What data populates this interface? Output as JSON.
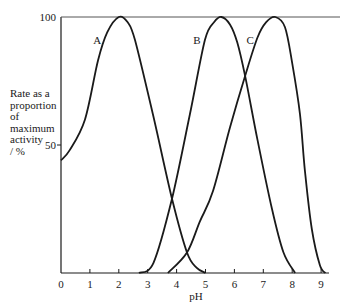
{
  "chart_data": {
    "type": "line",
    "title": "",
    "xlabel": "pH",
    "ylabel_lines": [
      "Rate as a",
      "proportion",
      "of",
      "maximum",
      "activity",
      "/ %"
    ],
    "ylabel": "Rate as a proportion of maximum activity / %",
    "xlim": [
      0,
      9.3
    ],
    "ylim": [
      0,
      100
    ],
    "x_ticks": [
      "0",
      "1",
      "2",
      "3",
      "4",
      "5",
      "6",
      "7",
      "8",
      "9"
    ],
    "y_ticks": [
      "50",
      "100"
    ],
    "grid": false,
    "legend": "inline curve labels",
    "series": [
      {
        "name": "A",
        "label_pos": [
          1.25,
          91
        ],
        "peak": [
          2.0,
          100
        ],
        "points": [
          [
            0,
            44
          ],
          [
            0.3,
            48
          ],
          [
            0.83,
            60
          ],
          [
            1.28,
            83
          ],
          [
            1.6,
            94
          ],
          [
            2.0,
            100
          ],
          [
            2.3,
            98
          ],
          [
            2.56,
            91
          ],
          [
            3.18,
            62
          ],
          [
            3.84,
            29
          ],
          [
            4.36,
            8
          ],
          [
            4.7,
            2
          ],
          [
            5.0,
            0
          ]
        ]
      },
      {
        "name": "B",
        "label_pos": [
          4.7,
          91
        ],
        "peak": [
          5.55,
          100
        ],
        "points": [
          [
            2.7,
            0
          ],
          [
            3.2,
            4
          ],
          [
            3.84,
            29
          ],
          [
            4.46,
            62
          ],
          [
            4.98,
            91
          ],
          [
            5.3,
            98
          ],
          [
            5.55,
            100
          ],
          [
            5.85,
            97
          ],
          [
            6.1,
            90
          ],
          [
            6.37,
            77
          ],
          [
            6.8,
            52
          ],
          [
            7.3,
            25
          ],
          [
            7.7,
            8
          ],
          [
            8.1,
            0
          ]
        ]
      },
      {
        "name": "C",
        "label_pos": [
          6.55,
          91
        ],
        "peak": [
          7.42,
          100
        ],
        "points": [
          [
            3.7,
            0
          ],
          [
            4.36,
            8
          ],
          [
            4.8,
            20
          ],
          [
            5.26,
            32
          ],
          [
            5.85,
            57
          ],
          [
            6.37,
            77
          ],
          [
            6.8,
            92
          ],
          [
            7.1,
            98
          ],
          [
            7.42,
            100
          ],
          [
            7.75,
            96
          ],
          [
            8.0,
            82
          ],
          [
            8.27,
            62
          ],
          [
            8.44,
            40
          ],
          [
            8.68,
            17
          ],
          [
            8.96,
            3
          ],
          [
            9.15,
            0
          ]
        ]
      }
    ]
  },
  "layout": {
    "x0_px": 61,
    "px_per_ph": 28.9,
    "y0_px": 273,
    "px_per_pct": 2.56,
    "x_axis_end_px": 329,
    "top_line_end_px": 340,
    "line_color": "#1a1a1a"
  }
}
